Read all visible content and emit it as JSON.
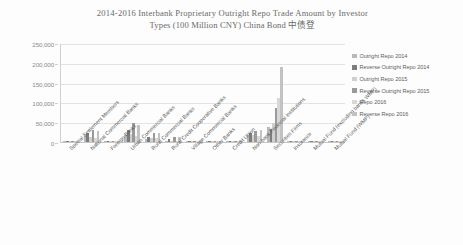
{
  "chart_data": {
    "type": "bar",
    "title": "2014-2016 Interbank Proprietary Outright Repo Trade Amount by Investor Types (100 Million CNY) China Bond 中债登",
    "title_line1": "2014-2016 Interbank Proprietary Outright Repo Trade Amount by Investor",
    "title_line2": "Types (100 Million CNY) China Bond 中债登",
    "xlabel": "",
    "ylabel": "",
    "ylim": [
      0,
      250000
    ],
    "yticks": [
      0,
      50000,
      100000,
      150000,
      200000,
      250000
    ],
    "ytick_labels": [
      "0",
      "50,000",
      "100,000",
      "150,000",
      "200,000",
      "250,000"
    ],
    "grid": true,
    "legend_position": "right",
    "categories": [
      "Special Settlement Members",
      "National Commercial Banks",
      "Foreign Banks",
      "Urban Commercial Banks",
      "Rural Commercial Banks",
      "Rural Credit Cooperative Banks",
      "Village Commercial Banks",
      "Other Banks",
      "Credit Union",
      "Non-bank Financial Institutions",
      "Securities Firms",
      "Insurance",
      "Mutual Fund (excluding banks WMP)",
      "Mutual Fund (WMP)"
    ],
    "series": [
      {
        "name": "Outright Repo 2014",
        "color": "#b8b8b8",
        "values": [
          900,
          17000,
          1200,
          17500,
          8500,
          1800,
          300,
          200,
          400,
          17000,
          38000,
          600,
          700,
          200
        ]
      },
      {
        "name": "Reverse Outright Repo 2014",
        "color": "#7d7d7d",
        "values": [
          700,
          23000,
          1400,
          31000,
          12000,
          7500,
          500,
          300,
          600,
          22000,
          34000,
          500,
          900,
          300
        ]
      },
      {
        "name": "Outright Repo 2015",
        "color": "#cfcfcf",
        "values": [
          1100,
          13000,
          900,
          20000,
          9000,
          2200,
          400,
          200,
          300,
          18000,
          47000,
          700,
          800,
          200
        ]
      },
      {
        "name": "Reverse Outright Repo 2015",
        "color": "#9a9a9a",
        "values": [
          1300,
          31000,
          1600,
          48000,
          22000,
          12500,
          700,
          400,
          800,
          28000,
          86000,
          900,
          1100,
          400
        ]
      },
      {
        "name": "Repo 2016",
        "color": "#d8d8d8",
        "values": [
          1000,
          11000,
          800,
          15000,
          9500,
          2600,
          300,
          200,
          400,
          16000,
          110000,
          600,
          900,
          300
        ]
      },
      {
        "name": "Reverse Repo 2016",
        "color": "#c2c2c2",
        "values": [
          1400,
          28000,
          1500,
          44000,
          24000,
          13500,
          600,
          500,
          900,
          30000,
          190000,
          1000,
          1300,
          500
        ]
      }
    ]
  },
  "legend": {
    "items": [
      {
        "label": "Outright Repo 2014",
        "color": "#b8b8b8"
      },
      {
        "label": "Reverse Outright Repo 2014",
        "color": "#7d7d7d"
      },
      {
        "label": "Outright Repo 2015",
        "color": "#cfcfcf"
      },
      {
        "label": "Reverse Outright Repo 2015",
        "color": "#9a9a9a"
      },
      {
        "label": "Repo 2016",
        "color": "#d8d8d8"
      },
      {
        "label": "Reverse Repo 2016",
        "color": "#c2c2c2"
      }
    ]
  }
}
